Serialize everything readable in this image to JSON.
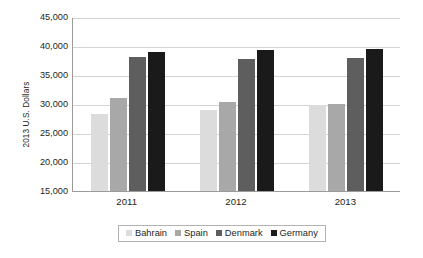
{
  "chart_data": {
    "type": "bar",
    "title": "",
    "subtitle": "",
    "xlabel": "",
    "ylabel": "2013 U.S. Dollars",
    "categories": [
      "2011",
      "2012",
      "2013"
    ],
    "series": [
      {
        "name": "Bahrain",
        "color": "#dcdcdc",
        "values": [
          28200,
          29000,
          29900
        ]
      },
      {
        "name": "Spain",
        "color": "#a8a8a8",
        "values": [
          31000,
          30400,
          30000
        ]
      },
      {
        "name": "Denmark",
        "color": "#5e5e5e",
        "values": [
          38100,
          37800,
          37900
        ]
      },
      {
        "name": "Germany",
        "color": "#1a1a1a",
        "values": [
          38900,
          39300,
          39500
        ]
      }
    ],
    "ylim": [
      15000,
      45000
    ],
    "ytick_values": [
      45000,
      40000,
      35000,
      30000,
      25000,
      20000,
      15000
    ],
    "ytick_labels": [
      "45,000",
      "40,000",
      "35,000",
      "30,000",
      "25,000",
      "20,000",
      "15,000"
    ],
    "grid": true,
    "legend_position": "bottom",
    "legend_entries": [
      "Bahrain",
      "Spain",
      "Denmark",
      "Germany"
    ],
    "annotations": []
  },
  "colors": {
    "gridline": "#d4d4d4",
    "axis": "#9b9b9b",
    "text": "#231f20",
    "legend_border": "#b3b3b3",
    "background": "#ffffff"
  }
}
